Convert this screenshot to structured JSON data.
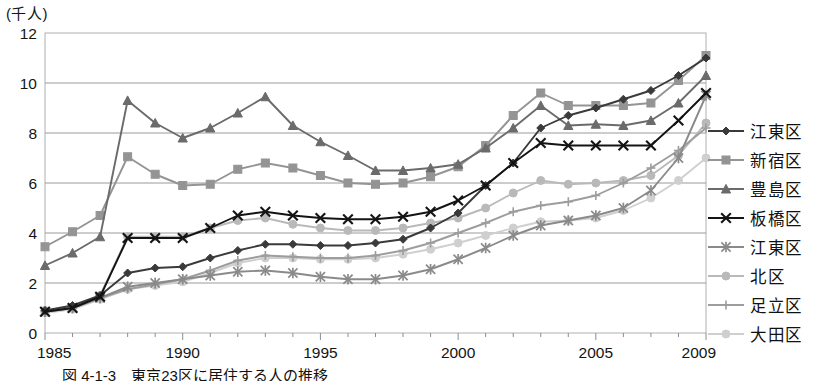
{
  "axis": {
    "y_unit_label": "(千人)",
    "y_ticks": [
      "0",
      "2",
      "4",
      "6",
      "8",
      "10",
      "12"
    ],
    "x_ticks": [
      "1985",
      "1990",
      "1995",
      "2000",
      "2005",
      "2009"
    ]
  },
  "legend": {
    "items": [
      {
        "label": "江東区",
        "marker": "diamond-marker",
        "color": "#3a3a3a"
      },
      {
        "label": "新宿区",
        "marker": "square-marker",
        "color": "#949494"
      },
      {
        "label": "豊島区",
        "marker": "triangle-marker",
        "color": "#6b6b6b"
      },
      {
        "label": "板橋区",
        "marker": "x-marker",
        "color": "#141414"
      },
      {
        "label": "江東区",
        "marker": "asterisk-marker",
        "color": "#8a8a8a"
      },
      {
        "label": "北区",
        "marker": "circle-marker",
        "color": "#b9b9b9"
      },
      {
        "label": "足立区",
        "marker": "plus-marker",
        "color": "#9d9d9d"
      },
      {
        "label": "大田区",
        "marker": "circle-marker",
        "color": "#cfcfcf"
      }
    ]
  },
  "caption": {
    "text": "図 4-1-3　東京23区に居住する人の推移"
  },
  "chart_data": {
    "type": "line",
    "title": "",
    "xlabel": "",
    "ylabel": "(千人)",
    "xlim": [
      1985,
      2009
    ],
    "ylim": [
      0,
      12
    ],
    "ytick_step": 2,
    "grid": true,
    "legend_position": "right",
    "x": [
      1985,
      1986,
      1987,
      1988,
      1989,
      1990,
      1991,
      1992,
      1993,
      1994,
      1995,
      1996,
      1997,
      1998,
      1999,
      2000,
      2001,
      2002,
      2003,
      2004,
      2005,
      2006,
      2007,
      2008,
      2009
    ],
    "series": [
      {
        "name": "江東区",
        "marker": "diamond",
        "color": "#3a3a3a",
        "values": [
          0.9,
          1.1,
          1.5,
          2.4,
          2.6,
          2.65,
          3.0,
          3.3,
          3.55,
          3.55,
          3.5,
          3.5,
          3.6,
          3.75,
          4.2,
          4.8,
          5.9,
          6.8,
          8.2,
          8.7,
          9.0,
          9.35,
          9.7,
          10.3,
          11.0
        ]
      },
      {
        "name": "新宿区",
        "marker": "square",
        "color": "#949494",
        "values": [
          3.45,
          4.05,
          4.7,
          7.05,
          6.35,
          5.9,
          5.95,
          6.55,
          6.8,
          6.6,
          6.3,
          6.0,
          5.95,
          6.0,
          6.25,
          6.65,
          7.5,
          8.7,
          9.6,
          9.1,
          9.1,
          9.1,
          9.2,
          10.1,
          11.1
        ]
      },
      {
        "name": "豊島区",
        "marker": "triangle",
        "color": "#6b6b6b",
        "values": [
          2.7,
          3.2,
          3.85,
          9.3,
          8.4,
          7.8,
          8.2,
          8.8,
          9.45,
          8.3,
          7.65,
          7.1,
          6.5,
          6.5,
          6.6,
          6.75,
          7.4,
          8.2,
          9.1,
          8.3,
          8.35,
          8.3,
          8.5,
          9.2,
          10.3
        ]
      },
      {
        "name": "板橋区",
        "marker": "x",
        "color": "#141414",
        "values": [
          0.85,
          1.0,
          1.45,
          3.8,
          3.8,
          3.8,
          4.2,
          4.7,
          4.85,
          4.7,
          4.6,
          4.55,
          4.55,
          4.65,
          4.85,
          5.3,
          5.9,
          6.8,
          7.6,
          7.5,
          7.5,
          7.5,
          7.5,
          8.5,
          9.6
        ]
      },
      {
        "name": "江東区",
        "marker": "asterisk",
        "color": "#8a8a8a",
        "values": [
          0.85,
          1.0,
          1.4,
          1.85,
          2.0,
          2.15,
          2.3,
          2.45,
          2.5,
          2.4,
          2.25,
          2.15,
          2.15,
          2.3,
          2.55,
          2.95,
          3.4,
          3.9,
          4.3,
          4.5,
          4.7,
          5.0,
          5.7,
          7.0,
          9.5
        ]
      },
      {
        "name": "北区",
        "marker": "circle",
        "color": "#b9b9b9",
        "values": [
          0.9,
          1.05,
          1.5,
          3.85,
          3.85,
          3.85,
          4.2,
          4.5,
          4.6,
          4.35,
          4.2,
          4.1,
          4.1,
          4.2,
          4.4,
          4.6,
          5.0,
          5.6,
          6.1,
          5.95,
          6.0,
          6.1,
          6.3,
          7.1,
          8.4
        ]
      },
      {
        "name": "足立区",
        "marker": "plus",
        "color": "#9d9d9d",
        "values": [
          0.85,
          1.0,
          1.4,
          1.75,
          1.95,
          2.15,
          2.5,
          2.9,
          3.1,
          3.05,
          3.0,
          3.0,
          3.1,
          3.3,
          3.6,
          4.0,
          4.4,
          4.85,
          5.1,
          5.25,
          5.5,
          6.0,
          6.6,
          7.3,
          8.2
        ]
      },
      {
        "name": "大田区",
        "marker": "circle",
        "color": "#cfcfcf",
        "values": [
          0.8,
          0.95,
          1.35,
          1.75,
          1.9,
          2.05,
          2.4,
          2.8,
          3.0,
          3.0,
          2.95,
          2.95,
          3.0,
          3.15,
          3.35,
          3.6,
          3.9,
          4.2,
          4.45,
          4.5,
          4.6,
          4.9,
          5.4,
          6.1,
          7.0
        ]
      }
    ]
  }
}
